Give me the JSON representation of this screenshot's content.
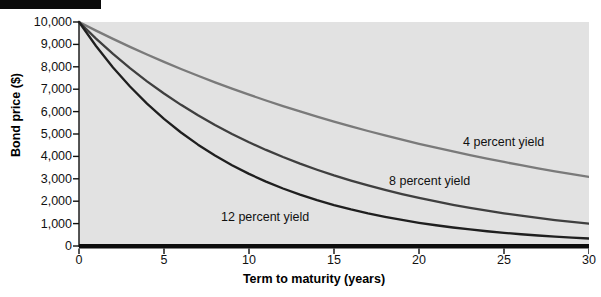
{
  "figure": {
    "background_color": "#ffffff",
    "plot_background_color": "#e2e2e2",
    "top_bar_color": "#0a0a0a"
  },
  "chart_data": {
    "type": "line",
    "title": "",
    "xlabel": "Term to maturity (years)",
    "ylabel": "Bond price ($)",
    "xlim": [
      0,
      30
    ],
    "ylim": [
      0,
      10000
    ],
    "grid": false,
    "legend": "inline-annotations",
    "xticks": [
      "0",
      "5",
      "10",
      "15",
      "20",
      "25",
      "30"
    ],
    "xtick_values": [
      0,
      5,
      10,
      15,
      20,
      25,
      30
    ],
    "yticks": [
      "0",
      "1,000",
      "2,000",
      "3,000",
      "4,000",
      "5,000",
      "6,000",
      "7,000",
      "8,000",
      "9,000",
      "10,000"
    ],
    "ytick_values": [
      0,
      1000,
      2000,
      3000,
      4000,
      5000,
      6000,
      7000,
      8000,
      9000,
      10000
    ],
    "x": [
      0,
      1,
      2,
      3,
      4,
      5,
      6,
      7,
      8,
      9,
      10,
      11,
      12,
      13,
      14,
      15,
      16,
      17,
      18,
      19,
      20,
      21,
      22,
      23,
      24,
      25,
      26,
      27,
      28,
      29,
      30
    ],
    "series": [
      {
        "name": "4 percent yield",
        "rate": 0.04,
        "color": "#7a7a7a",
        "annotation": "4 percent yield",
        "values": [
          10000,
          9615,
          9246,
          8890,
          8548,
          8219,
          7903,
          7599,
          7307,
          7026,
          6756,
          6496,
          6246,
          6006,
          5775,
          5553,
          5339,
          5134,
          4936,
          4746,
          4564,
          4388,
          4220,
          4057,
          3901,
          3751,
          3607,
          3468,
          3335,
          3207,
          3083
        ]
      },
      {
        "name": "8 percent yield",
        "rate": 0.08,
        "color": "#3f3f3f",
        "annotation": "8 percent yield",
        "values": [
          10000,
          9259,
          8573,
          7938,
          7350,
          6806,
          6302,
          5835,
          5403,
          5002,
          4632,
          4289,
          3971,
          3677,
          3405,
          3152,
          2919,
          2703,
          2502,
          2317,
          2145,
          1987,
          1839,
          1703,
          1577,
          1460,
          1352,
          1252,
          1159,
          1073,
          994
        ]
      },
      {
        "name": "12 percent yield",
        "rate": 0.12,
        "color": "#1f1f1f",
        "annotation": "12 percent yield",
        "values": [
          10000,
          8929,
          7972,
          7118,
          6355,
          5674,
          5066,
          4523,
          4039,
          3606,
          3220,
          2875,
          2567,
          2292,
          2046,
          1827,
          1631,
          1456,
          1300,
          1161,
          1037,
          926,
          826,
          738,
          659,
          588,
          525,
          469,
          419,
          374,
          334
        ]
      }
    ]
  }
}
